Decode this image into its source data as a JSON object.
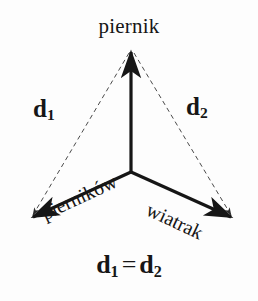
{
  "figure": {
    "type": "vector-diagram",
    "background_color": "#fdfdfd",
    "ink_color": "#161616",
    "title_label": "piernik",
    "labels": {
      "top": "piernik",
      "left_distance": "d",
      "left_distance_sub": "1",
      "right_distance": "d",
      "right_distance_sub": "2",
      "left_arm": "pierników",
      "right_arm": "wiatrak",
      "equation_left": "d",
      "equation_left_sub": "1",
      "equation_sign": "=",
      "equation_right": "d",
      "equation_right_sub": "2"
    },
    "geometry": {
      "center_x": 131,
      "center_y": 172,
      "vertices": [
        {
          "name": "top-arrow-tip",
          "x": 131,
          "y": 46
        },
        {
          "name": "left-arrow-tip",
          "x": 26,
          "y": 222
        },
        {
          "name": "right-arrow-tip",
          "x": 238,
          "y": 222
        }
      ],
      "solid_arrows": 3,
      "dashed_connectors": 2,
      "left_arm_rotation_deg": -25,
      "right_arm_rotation_deg": 25
    }
  }
}
